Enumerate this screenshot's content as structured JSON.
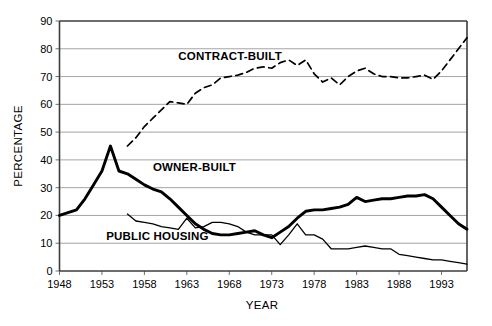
{
  "chart_data": {
    "type": "line",
    "title": "",
    "xlabel": "YEAR",
    "ylabel": "PERCENTAGE",
    "xlim": [
      1948,
      1996
    ],
    "ylim": [
      0,
      90
    ],
    "ytick_step": 10,
    "xtick_step": 5,
    "grid": true,
    "legend_position": "inline-annotations",
    "yticks": [
      "0",
      "10",
      "20",
      "30",
      "40",
      "50",
      "60",
      "70",
      "80",
      "90"
    ],
    "xticks": [
      "1948",
      "1953",
      "1958",
      "1963",
      "1968",
      "1973",
      "1978",
      "1983",
      "1988",
      "1993"
    ],
    "series": [
      {
        "name": "CONTRACT-BUILT",
        "style": "dashed",
        "label_x": 1962,
        "label_y": 76,
        "x": [
          1956,
          1957,
          1958,
          1959,
          1960,
          1961,
          1962,
          1963,
          1964,
          1965,
          1966,
          1967,
          1968,
          1969,
          1970,
          1971,
          1972,
          1973,
          1974,
          1975,
          1976,
          1977,
          1978,
          1979,
          1980,
          1981,
          1982,
          1983,
          1984,
          1985,
          1986,
          1987,
          1988,
          1989,
          1990,
          1991,
          1992,
          1993,
          1994,
          1995,
          1996
        ],
        "values": [
          45,
          48,
          52,
          55,
          58,
          61,
          60.5,
          60,
          64,
          66,
          67,
          69.5,
          70,
          70.5,
          71.5,
          73,
          73.5,
          73,
          75,
          76,
          74,
          76,
          71,
          68,
          69.5,
          67,
          70,
          72,
          73,
          71,
          70,
          70,
          69.5,
          69.5,
          70,
          70.5,
          69,
          72,
          76,
          80,
          84
        ]
      },
      {
        "name": "OWNER-BUILT",
        "style": "thick-solid",
        "label_x": 1959,
        "label_y": 36,
        "x": [
          1948,
          1949,
          1950,
          1951,
          1952,
          1953,
          1954,
          1955,
          1956,
          1957,
          1958,
          1959,
          1960,
          1961,
          1962,
          1963,
          1964,
          1965,
          1966,
          1967,
          1968,
          1969,
          1970,
          1971,
          1972,
          1973,
          1974,
          1975,
          1976,
          1977,
          1978,
          1979,
          1980,
          1981,
          1982,
          1983,
          1984,
          1985,
          1986,
          1987,
          1988,
          1989,
          1990,
          1991,
          1992,
          1993,
          1994,
          1995,
          1996
        ],
        "values": [
          20,
          21,
          22,
          26,
          31,
          36,
          45,
          36,
          35,
          33,
          31,
          29.5,
          28.5,
          26,
          23,
          20,
          17,
          15,
          13.5,
          13,
          13,
          13.5,
          14,
          14.5,
          13,
          12,
          14,
          16,
          19,
          21.5,
          22,
          22,
          22.5,
          23,
          24,
          26.5,
          25,
          25.5,
          26,
          26,
          26.5,
          27,
          27,
          27.5,
          26,
          23,
          20,
          17,
          15
        ]
      },
      {
        "name": "PUBLIC HOUSING",
        "style": "thin-solid",
        "label_x": 1953.5,
        "label_y": 11,
        "x": [
          1956,
          1957,
          1958,
          1959,
          1960,
          1961,
          1962,
          1963,
          1964,
          1965,
          1966,
          1967,
          1968,
          1969,
          1970,
          1971,
          1972,
          1973,
          1974,
          1975,
          1976,
          1977,
          1978,
          1979,
          1980,
          1981,
          1982,
          1983,
          1984,
          1985,
          1986,
          1987,
          1988,
          1989,
          1990,
          1991,
          1992,
          1993,
          1994,
          1995,
          1996
        ],
        "values": [
          20.5,
          18,
          17.5,
          17,
          16,
          15.5,
          15,
          19,
          15.5,
          16,
          17.5,
          17.5,
          17,
          16,
          14,
          13,
          13,
          13,
          9.5,
          13,
          17,
          13,
          13,
          11.5,
          8,
          8,
          8,
          8.5,
          9,
          8.5,
          8,
          8,
          6,
          5.5,
          5,
          4.5,
          4,
          4,
          3.5,
          3,
          2.5
        ]
      }
    ]
  }
}
